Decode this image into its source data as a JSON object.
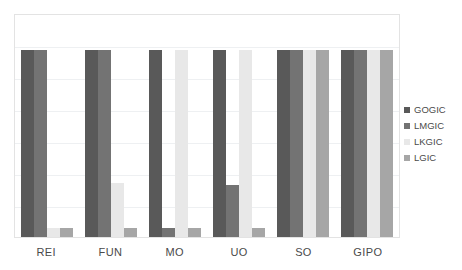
{
  "chart_data": {
    "type": "bar",
    "title": "",
    "subtitle": "",
    "xlabel": "",
    "ylabel": "",
    "grid": true,
    "legend_position": "right",
    "ylim": [
      0,
      1.2
    ],
    "categories": [
      "REI",
      "FUN",
      "MO",
      "UO",
      "SO",
      "GIPO"
    ],
    "series": [
      {
        "name": "GOGIC",
        "color": "#595959",
        "values": [
          1.0,
          1.0,
          1.0,
          1.0,
          1.0,
          1.0
        ]
      },
      {
        "name": "LMGIC",
        "color": "#737373",
        "values": [
          1.0,
          1.0,
          0.05,
          0.28,
          1.0,
          1.0
        ]
      },
      {
        "name": "LKGIC",
        "color": "#e8e8e8",
        "values": [
          0.05,
          0.29,
          1.0,
          1.0,
          1.0,
          1.0
        ]
      },
      {
        "name": "LGIC",
        "color": "#a6a6a6",
        "values": [
          0.05,
          0.05,
          0.05,
          0.05,
          1.0,
          1.0
        ]
      }
    ],
    "gridline_count": 6,
    "axis_tick_labels": []
  },
  "legend": {
    "entries": [
      {
        "label": "GOGIC",
        "color": "#595959"
      },
      {
        "label": "LMGIC",
        "color": "#737373"
      },
      {
        "label": "LKGIC",
        "color": "#e8e8e8"
      },
      {
        "label": "LGIC",
        "color": "#a6a6a6"
      }
    ]
  },
  "axis": {
    "x_tick_labels": [
      "REI",
      "FUN",
      "MO",
      "UO",
      "SO",
      "GIPO"
    ]
  }
}
